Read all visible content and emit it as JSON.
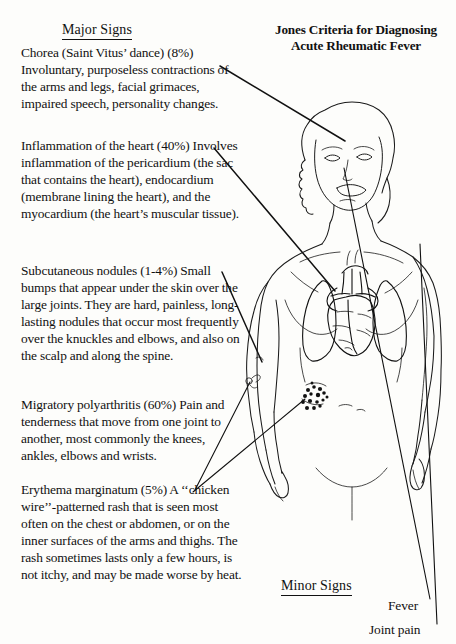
{
  "title": {
    "line1": "Jones Criteria for Diagnosing",
    "line2": "Acute Rheumatic Fever"
  },
  "sections": {
    "major_heading": "Major Signs",
    "minor_heading": "Minor Signs"
  },
  "major_signs": [
    {
      "id": "chorea",
      "title": "Chorea (Saint Vitus’ dance) (8%)",
      "description": "Involuntary, purposeless contractions of the arms and legs, facial grimaces, impaired speech, personality changes.",
      "percent": "8%"
    },
    {
      "id": "carditis",
      "title": "Inflammation of the heart (40%)",
      "description": "Involves inflammation of the pericardium (the sac that contains the heart), endocardium (membrane lining the heart), and the myocardium (the heart’s muscular tissue).",
      "percent": "40%"
    },
    {
      "id": "nodules",
      "title": "Subcutaneous nodules (1-4%)",
      "description": "Small bumps that appear under the skin over the large joints. They are hard, painless, long-lasting nodules that occur most frequently over the knuckles and elbows, and also on the scalp and along the spine.",
      "percent": "1-4%"
    },
    {
      "id": "arthritis",
      "title": "Migratory polyarthritis (60%)",
      "description": "Pain and tenderness that move from one joint to another, most commonly the knees, ankles, elbows and wrists.",
      "percent": "60%"
    },
    {
      "id": "erythema",
      "title": "Erythema marginatum (5%)",
      "description": "A ‘‘chicken wire’’-patterned rash that is seen most often on the chest or abdomen, or on the inner surfaces of the arms and thighs. The rash sometimes lasts only a few hours, is not itchy, and may be made worse by heat.",
      "percent": "5%"
    }
  ],
  "minor_signs": [
    {
      "id": "fever",
      "label": "Fever"
    },
    {
      "id": "joint-pain",
      "label": "Joint pain"
    }
  ],
  "figure": {
    "name": "human-torso-anatomical-illustration",
    "organs": [
      "heart",
      "lungs",
      "erythema-marginatum-rash",
      "subcutaneous-nodule"
    ]
  },
  "colors": {
    "ink": "#111111",
    "paper": "#fdfdfb"
  }
}
